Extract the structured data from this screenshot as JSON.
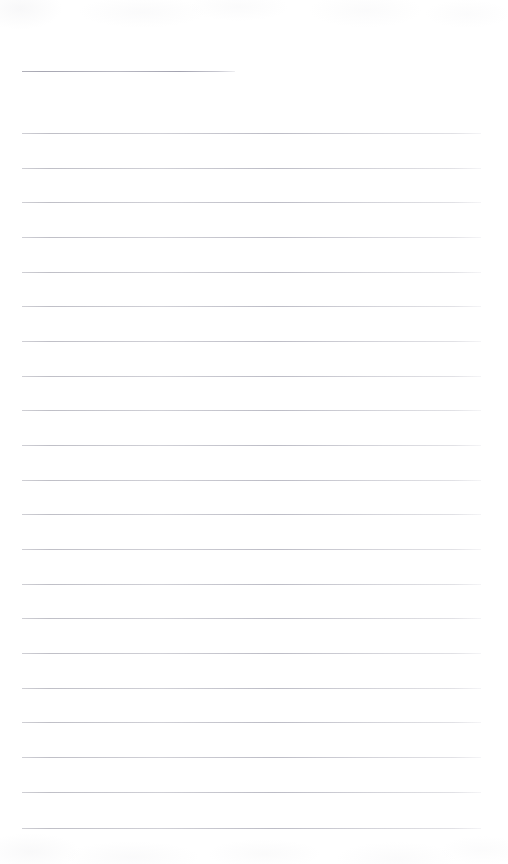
{
  "document": {
    "kind": "lined-paper",
    "title_text": "",
    "body_text": "",
    "page_width": 508,
    "page_height": 864,
    "background_color": "#ffffff",
    "rule_color": "#c0c0c8",
    "rule_thickness_px": 1,
    "left_margin_px": 22,
    "right_edge_px": 481,
    "line_spacing_px": 34.7,
    "title_rule": {
      "name": "title-rule",
      "x": 22,
      "y": 71,
      "width": 213,
      "label": ""
    },
    "body_rules": [
      {
        "y": 133,
        "x": 22,
        "width": 459,
        "text": ""
      },
      {
        "y": 168,
        "x": 22,
        "width": 459,
        "text": ""
      },
      {
        "y": 202,
        "x": 22,
        "width": 459,
        "text": ""
      },
      {
        "y": 237,
        "x": 22,
        "width": 459,
        "text": ""
      },
      {
        "y": 272,
        "x": 22,
        "width": 459,
        "text": ""
      },
      {
        "y": 306,
        "x": 22,
        "width": 459,
        "text": ""
      },
      {
        "y": 341,
        "x": 22,
        "width": 459,
        "text": ""
      },
      {
        "y": 376,
        "x": 22,
        "width": 459,
        "text": ""
      },
      {
        "y": 410,
        "x": 22,
        "width": 459,
        "text": ""
      },
      {
        "y": 445,
        "x": 22,
        "width": 459,
        "text": ""
      },
      {
        "y": 480,
        "x": 22,
        "width": 459,
        "text": ""
      },
      {
        "y": 514,
        "x": 22,
        "width": 459,
        "text": ""
      },
      {
        "y": 549,
        "x": 22,
        "width": 459,
        "text": ""
      },
      {
        "y": 584,
        "x": 22,
        "width": 459,
        "text": ""
      },
      {
        "y": 618,
        "x": 22,
        "width": 459,
        "text": ""
      },
      {
        "y": 653,
        "x": 22,
        "width": 459,
        "text": ""
      },
      {
        "y": 688,
        "x": 22,
        "width": 459,
        "text": ""
      },
      {
        "y": 722,
        "x": 22,
        "width": 459,
        "text": ""
      },
      {
        "y": 757,
        "x": 22,
        "width": 459,
        "text": ""
      },
      {
        "y": 792,
        "x": 22,
        "width": 459,
        "text": ""
      },
      {
        "y": 828,
        "x": 22,
        "width": 459,
        "text": ""
      }
    ]
  }
}
